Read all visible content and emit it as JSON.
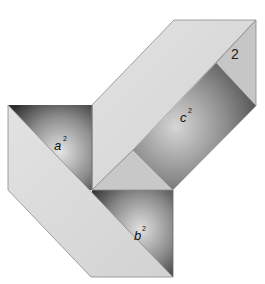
{
  "diagram": {
    "colors": {
      "light_face": "#dcdcdc",
      "mid_face": "#c4c4c4",
      "dark_square_edge": "#3a3a3a",
      "dark_square_center": "#d8d8d8",
      "outline": "#8a8a8a",
      "background": "#ffffff"
    },
    "labels": {
      "a_base": "a",
      "a_exp": "2",
      "b_base": "b",
      "b_exp": "2",
      "c_base": "c",
      "c_exp": "2",
      "marker": "2"
    },
    "shapes": [
      {
        "name": "square-a",
        "label": "a²"
      },
      {
        "name": "square-b",
        "label": "b²"
      },
      {
        "name": "square-c",
        "label": "c²"
      },
      {
        "name": "strip-upper-parallelogram"
      },
      {
        "name": "strip-lower-parallelogram"
      },
      {
        "name": "center-triangle"
      },
      {
        "name": "right-end-triangle"
      }
    ]
  }
}
